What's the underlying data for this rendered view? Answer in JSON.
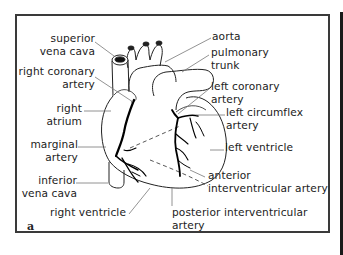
{
  "figure": {
    "panel_letter": "a"
  },
  "labels": {
    "superior_vena_cava": [
      "superior",
      "vena cava"
    ],
    "right_coronary_artery": [
      "right coronary",
      "artery"
    ],
    "right_atrium": [
      "right",
      "atrium"
    ],
    "marginal_artery": [
      "marginal",
      "artery"
    ],
    "inferior_vena_cava": [
      "inferior",
      "vena cava"
    ],
    "right_ventricle": [
      "right ventricle"
    ],
    "aorta": [
      "aorta"
    ],
    "pulmonary_trunk": [
      "pulmonary",
      "trunk"
    ],
    "left_coronary_artery": [
      "left coronary",
      "artery"
    ],
    "left_circumflex_artery": [
      "left circumflex",
      "artery"
    ],
    "left_ventricle": [
      "left ventricle"
    ],
    "anterior_interventricular_artery": [
      "anterior",
      "interventricular artery"
    ],
    "posterior_interventricular_artery": [
      "posterior interventricular",
      "artery"
    ]
  },
  "colors": {
    "outline": "#222222",
    "leader": "#666666",
    "artery": "#000000",
    "frame": "#3a3a3a"
  }
}
